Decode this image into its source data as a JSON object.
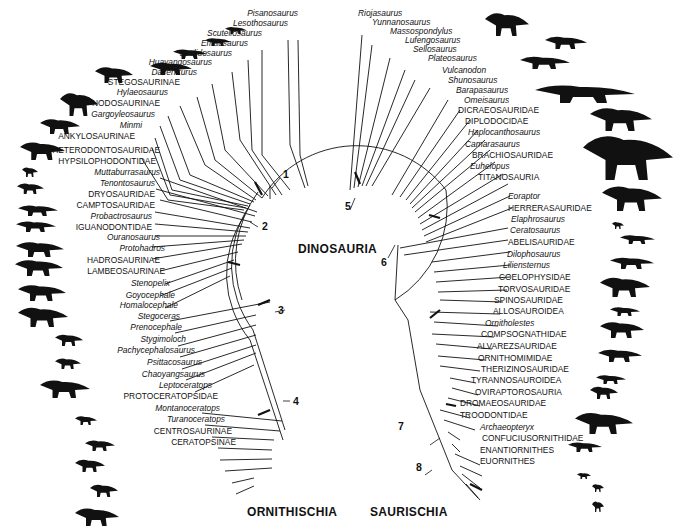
{
  "title": "DINOSAURIA",
  "groups": {
    "left": "ORNITHISCHIA",
    "right": "SAURISCHIA"
  },
  "nodes": {
    "n1": "1",
    "n2": "2",
    "n3": "3",
    "n4": "4",
    "n5": "5",
    "n6": "6",
    "n7": "7",
    "n8": "8"
  },
  "ornithischia_taxa": [
    {
      "name": "Pisanosaurus",
      "italic": true
    },
    {
      "name": "Lesothosaurus",
      "italic": true
    },
    {
      "name": "Scutellosaurus",
      "italic": true
    },
    {
      "name": "Emausaurus",
      "italic": true
    },
    {
      "name": "Scelidosaurus",
      "italic": true
    },
    {
      "name": "Huayangosaurus",
      "italic": true
    },
    {
      "name": "Dacentrurus",
      "italic": true
    },
    {
      "name": "STEGOSAURINAE",
      "italic": false
    },
    {
      "name": "Hylaeosaurus",
      "italic": true
    },
    {
      "name": "NODOSAURINAE",
      "italic": false
    },
    {
      "name": "Gargoyleosaurus",
      "italic": true
    },
    {
      "name": "Minmi",
      "italic": true
    },
    {
      "name": "ANKYLOSAURINAE",
      "italic": false
    },
    {
      "name": "HETERODONTOSAURIDAE",
      "italic": false
    },
    {
      "name": "HYPSILOPHODONTIDAE",
      "italic": false
    },
    {
      "name": "Muttaburrasaurus",
      "italic": true
    },
    {
      "name": "Tenontosaurus",
      "italic": true
    },
    {
      "name": "DRYOSAURIDAE",
      "italic": false
    },
    {
      "name": "CAMPTOSAURIDAE",
      "italic": false
    },
    {
      "name": "Probactrosaurus",
      "italic": true
    },
    {
      "name": "IGUANODONTIDAE",
      "italic": false
    },
    {
      "name": "Ouranosaurus",
      "italic": true
    },
    {
      "name": "Protohadros",
      "italic": true
    },
    {
      "name": "HADROSAURINAE",
      "italic": false
    },
    {
      "name": "LAMBEOSAURINAE",
      "italic": false
    },
    {
      "name": "Stenopelix",
      "italic": true
    },
    {
      "name": "Goyocephale",
      "italic": true
    },
    {
      "name": "Homalocephale",
      "italic": true
    },
    {
      "name": "Stegoceras",
      "italic": true
    },
    {
      "name": "Prenocephale",
      "italic": true
    },
    {
      "name": "Stygimoloch",
      "italic": true
    },
    {
      "name": "Pachycephalosaurus",
      "italic": true
    },
    {
      "name": "Psittacosaurus",
      "italic": true
    },
    {
      "name": "Chaoyangsaurus",
      "italic": true
    },
    {
      "name": "Leptoceratops",
      "italic": true
    },
    {
      "name": "PROTOCERATOPSIDAE",
      "italic": false
    },
    {
      "name": "Montanoceratops",
      "italic": true
    },
    {
      "name": "Turanoceratops",
      "italic": true
    },
    {
      "name": "CENTROSAURINAE",
      "italic": false
    },
    {
      "name": "CERATOPSINAE",
      "italic": false
    }
  ],
  "saurischia_taxa": [
    {
      "name": "Riojasaurus",
      "italic": true
    },
    {
      "name": "Yunnanosaurus",
      "italic": true
    },
    {
      "name": "Massospondylus",
      "italic": true
    },
    {
      "name": "Lufengosaurus",
      "italic": true
    },
    {
      "name": "Sellosaurus",
      "italic": true
    },
    {
      "name": "Plateosaurus",
      "italic": true
    },
    {
      "name": "Vulcanodon",
      "italic": true
    },
    {
      "name": "Shunosaurus",
      "italic": true
    },
    {
      "name": "Barapasaurus",
      "italic": true
    },
    {
      "name": "Omeisaurus",
      "italic": true
    },
    {
      "name": "DICRAEOSAURIDAE",
      "italic": false
    },
    {
      "name": "DIPLODOCIDAE",
      "italic": false
    },
    {
      "name": "Haplocanthosaurus",
      "italic": true
    },
    {
      "name": "Camarasaurus",
      "italic": true
    },
    {
      "name": "BRACHIOSAURIDAE",
      "italic": false
    },
    {
      "name": "Euhelopus",
      "italic": true
    },
    {
      "name": "TITANOSAURIA",
      "italic": false
    },
    {
      "name": "Eoraptor",
      "italic": true
    },
    {
      "name": "HERRERASAURIDAE",
      "italic": false
    },
    {
      "name": "Elaphrosaurus",
      "italic": true
    },
    {
      "name": "Ceratosaurus",
      "italic": true
    },
    {
      "name": "ABELISAURIDAE",
      "italic": false
    },
    {
      "name": "Dilophosaurus",
      "italic": true
    },
    {
      "name": "Liliensternus",
      "italic": true
    },
    {
      "name": "COELOPHYSIDAE",
      "italic": false
    },
    {
      "name": "TORVOSAURIDAE",
      "italic": false
    },
    {
      "name": "SPINOSAURIDAE",
      "italic": false
    },
    {
      "name": "ALLOSAUROIDEA",
      "italic": false
    },
    {
      "name": "Ornitholestes",
      "italic": true
    },
    {
      "name": "COMPSOGNATHIDAE",
      "italic": false
    },
    {
      "name": "ALVAREZSAURIDAE",
      "italic": false
    },
    {
      "name": "ORNITHOMIMIDAE",
      "italic": false
    },
    {
      "name": "THERIZINOSAURIDAE",
      "italic": false
    },
    {
      "name": "TYRANNOSAUROIDEA",
      "italic": false
    },
    {
      "name": "OVIRAPTOROSAURIA",
      "italic": false
    },
    {
      "name": "DROMAEOSAURIDAE",
      "italic": false
    },
    {
      "name": "TROODONTIDAE",
      "italic": false
    },
    {
      "name": "Archaeopteryx",
      "italic": true
    },
    {
      "name": "CONFUCIUSORNITHIDAE",
      "italic": false
    },
    {
      "name": "ENANTIORNITHES",
      "italic": false
    },
    {
      "name": "EUORNITHES",
      "italic": false
    }
  ],
  "silhouettes": {
    "left": [
      "small-theropod-like",
      "small-theropod-like",
      "ornithopod",
      "ornithopod",
      "stegosaur",
      "stegosaur",
      "ankylosaur",
      "ankylosaur",
      "small-ornithopod",
      "small-ornithopod",
      "ornithopod",
      "ornithopod",
      "ornithopod",
      "iguanodont",
      "hadrosaur",
      "hadrosaur",
      "pachycephalosaur",
      "pachycephalosaur",
      "pachycephalosaur",
      "psittacosaur",
      "ceratopsian",
      "ceratopsian",
      "ceratopsian",
      "ceratopsid"
    ],
    "right": [
      "prosauropod",
      "prosauropod",
      "sauropod",
      "sauropod",
      "sauropod",
      "sauropod",
      "sauropod",
      "small-theropod",
      "theropod",
      "theropod",
      "theropod",
      "theropod",
      "theropod",
      "theropod",
      "theropod",
      "theropod",
      "tyrannosaur",
      "theropod",
      "bird",
      "bird",
      "bird"
    ]
  }
}
